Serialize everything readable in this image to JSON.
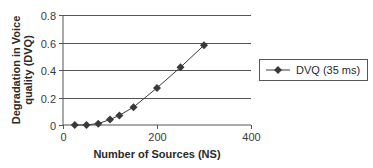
{
  "chart_data": {
    "type": "line",
    "title": "",
    "xlabel": "Number of Sources (NS)",
    "ylabel_line1": "Degradation in Voice",
    "ylabel_line2": "quality (DVQ)",
    "ylabel": "Degradation in Voice quality (DVQ)",
    "xlim": [
      0,
      400
    ],
    "ylim": [
      0,
      0.8
    ],
    "x_ticks": [
      "0",
      "200",
      "400"
    ],
    "y_ticks": [
      "0",
      "0.2",
      "0.4",
      "0.6",
      "0.8"
    ],
    "grid": "horizontal",
    "legend_position": "right",
    "series": [
      {
        "name": "DVQ (35 ms)",
        "marker": "diamond",
        "color": "#3a3a3a",
        "x": [
          25,
          50,
          75,
          100,
          120,
          150,
          200,
          250,
          300
        ],
        "values": [
          0.0,
          0.0,
          0.01,
          0.04,
          0.07,
          0.13,
          0.27,
          0.42,
          0.58
        ]
      }
    ]
  },
  "legend": {
    "items": [
      {
        "label": "DVQ (35 ms)"
      }
    ]
  }
}
